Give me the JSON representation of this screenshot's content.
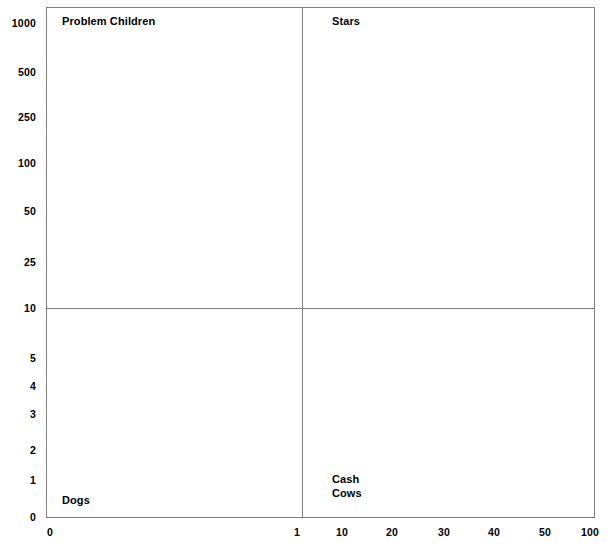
{
  "chart_data": {
    "type": "scatter",
    "title": "",
    "subtitle": "",
    "xlabel": "",
    "ylabel": "",
    "grid": false,
    "legend": "none",
    "series": [],
    "annotations": [
      {
        "text": "Problem Children",
        "quadrant": "top-left"
      },
      {
        "text": "Stars",
        "quadrant": "top-right"
      },
      {
        "text": "Dogs",
        "quadrant": "bottom-left"
      },
      {
        "text": "Cash\nCows",
        "quadrant": "bottom-right"
      }
    ],
    "xaxis": {
      "tick_labels": [
        "0",
        "1",
        "10",
        "20",
        "30",
        "40",
        "50",
        "100"
      ],
      "tick_positions_px": [
        50,
        297,
        342,
        392,
        444,
        494,
        545,
        590
      ],
      "scale": "log-like"
    },
    "yaxis": {
      "tick_labels": [
        "1000",
        "500",
        "250",
        "100",
        "50",
        "25",
        "10",
        "5",
        "4",
        "3",
        "2",
        "1",
        "0"
      ],
      "tick_positions_px": [
        23,
        72,
        117,
        163,
        211,
        262,
        308,
        358,
        386,
        414,
        450,
        480,
        517
      ],
      "scale": "log-like"
    },
    "quadrant_divider": {
      "x_value": "1",
      "y_value": "10"
    }
  },
  "axes": {
    "y_ticks": [
      {
        "label": "1000",
        "y": 23
      },
      {
        "label": "500",
        "y": 72
      },
      {
        "label": "250",
        "y": 117
      },
      {
        "label": "100",
        "y": 163
      },
      {
        "label": "50",
        "y": 211
      },
      {
        "label": "25",
        "y": 262
      },
      {
        "label": "10",
        "y": 308
      },
      {
        "label": "5",
        "y": 358
      },
      {
        "label": "4",
        "y": 386
      },
      {
        "label": "3",
        "y": 414
      },
      {
        "label": "2",
        "y": 450
      },
      {
        "label": "1",
        "y": 480
      },
      {
        "label": "0",
        "y": 517
      }
    ],
    "x_ticks": [
      {
        "label": "0",
        "x": 50
      },
      {
        "label": "1",
        "x": 297
      },
      {
        "label": "10",
        "x": 342
      },
      {
        "label": "20",
        "x": 392
      },
      {
        "label": "30",
        "x": 444
      },
      {
        "label": "40",
        "x": 494
      },
      {
        "label": "50",
        "x": 545
      },
      {
        "label": "100",
        "x": 590
      }
    ]
  },
  "quadrants": {
    "top_left_label": "Problem Children",
    "top_right_label": "Stars",
    "bottom_left_label": "Dogs",
    "bottom_right_label": "Cash\nCows"
  },
  "colors": {
    "background": "#ffffff",
    "frame": "#808080",
    "divider": "#808080",
    "text": "#000000"
  }
}
